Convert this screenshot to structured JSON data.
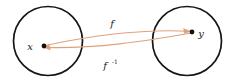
{
  "figure": {
    "name": "bijection-inverse-function-diagram",
    "background_color": "#ffffff",
    "width": 234,
    "height": 83
  },
  "sets": {
    "left": {
      "name": "domain-set-circle",
      "stroke_color": "#151515",
      "cx": 48,
      "cy": 41,
      "r": 35
    },
    "right": {
      "name": "codomain-set-circle",
      "stroke_color": "#151515",
      "cx": 187,
      "cy": 41,
      "r": 35
    }
  },
  "points": [
    {
      "id": "x",
      "label": "x",
      "label_x": 30,
      "label_y": 50,
      "dot_x": 44,
      "dot_y": 46,
      "color": "#111111"
    },
    {
      "id": "y",
      "label": "y",
      "label_x": 200,
      "label_y": 37,
      "dot_x": 192,
      "dot_y": 32,
      "color": "#111111"
    }
  ],
  "arrows": [
    {
      "id": "forward",
      "label": "f",
      "label_x": 112,
      "label_y": 26,
      "from": "x",
      "to": "y",
      "color": "#e0a179",
      "direction": "left-to-right"
    },
    {
      "id": "inverse",
      "label_base": "f",
      "label_exponent": "-1",
      "label_x": 108,
      "label_y": 68,
      "from": "y",
      "to": "x",
      "color": "#e0a179",
      "direction": "right-to-left"
    }
  ],
  "colors": {
    "circle_stroke": "#151515",
    "arrow_stroke": "#e0a179",
    "point_fill": "#111111",
    "label_fill": "#1a1a1a",
    "background": "#ffffff"
  }
}
